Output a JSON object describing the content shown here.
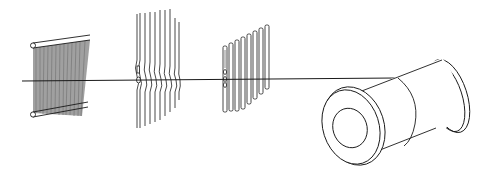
{
  "diagram": {
    "title": "",
    "colors": {
      "background": "#ffffff",
      "stroke": "#1a1a1a",
      "fill_warp": "#9a9a9a"
    },
    "components": [
      {
        "id": "warp-frame",
        "label": "",
        "icon": "frame-with-warp-threads"
      },
      {
        "id": "heddle-wires",
        "label": "",
        "icon": "heddle-wires"
      },
      {
        "id": "heddle-strips",
        "label": "",
        "icon": "heddle-strips-with-eyes"
      },
      {
        "id": "beam-spool",
        "label": "",
        "icon": "cylindrical-beam"
      },
      {
        "id": "thread-line",
        "label": "",
        "icon": "thread-line"
      }
    ]
  }
}
